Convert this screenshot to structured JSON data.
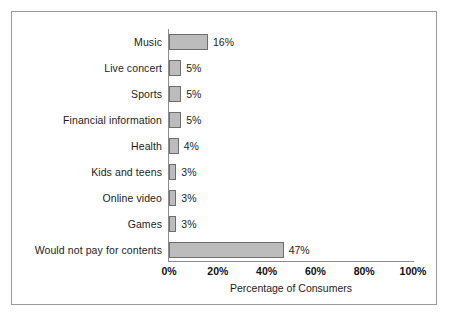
{
  "chart_data": {
    "type": "bar",
    "orientation": "horizontal",
    "title": "",
    "xlabel": "Percentage of Consumers",
    "ylabel": "",
    "xlim": [
      0,
      100
    ],
    "xticks": [
      0,
      20,
      40,
      60,
      80,
      100
    ],
    "xtick_labels": [
      "0%",
      "20%",
      "40%",
      "60%",
      "80%",
      "100%"
    ],
    "grid": false,
    "legend": null,
    "bar_fill_color": "#bcbcbc",
    "bar_border_color": "#6e6e6e",
    "categories": [
      "Music",
      "Live concert",
      "Sports",
      "Financial information",
      "Health",
      "Kids and teens",
      "Online video",
      "Games",
      "Would not pay for contents"
    ],
    "values": [
      16,
      5,
      5,
      5,
      4,
      3,
      3,
      3,
      47
    ],
    "value_labels": [
      "16%",
      "5%",
      "5%",
      "5%",
      "4%",
      "3%",
      "3%",
      "3%",
      "47%"
    ]
  },
  "figure": {
    "border_color": "#9a9a9a",
    "background": "#ffffff",
    "axis_color": "#8c8c8c"
  }
}
